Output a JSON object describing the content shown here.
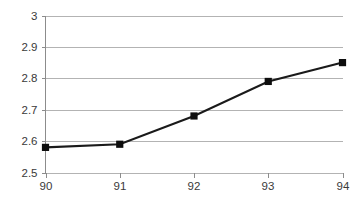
{
  "chart_data": {
    "type": "line",
    "title": "",
    "subtitle": "",
    "xlabel": "",
    "ylabel": "",
    "x": [
      90,
      91,
      92,
      93,
      94
    ],
    "categories": [
      "90",
      "91",
      "92",
      "93",
      "94"
    ],
    "values": [
      2.58,
      2.59,
      2.68,
      2.79,
      2.85
    ],
    "series": [
      {
        "name": "",
        "values": [
          2.58,
          2.59,
          2.68,
          2.79,
          2.85
        ]
      }
    ],
    "xlim": [
      90,
      94
    ],
    "ylim": [
      2.5,
      3.0
    ],
    "xticks": [
      "90",
      "91",
      "92",
      "93",
      "94"
    ],
    "yticks": [
      "2.5",
      "2.6",
      "2.7",
      "2.8",
      "2.9",
      "3"
    ],
    "ytick_values": [
      2.5,
      2.6,
      2.7,
      2.8,
      2.9,
      3.0
    ],
    "grid": "horizontal",
    "legend": "none",
    "marker": "square",
    "colors": {
      "line": "#1a1a1a",
      "marker": "#0d0d0d",
      "gridline": "#b3b3b3",
      "axis": "#8c8c8c",
      "label": "#3a3a3a",
      "background": "#ffffff"
    }
  },
  "axis": {
    "y_tick_labels": [
      "3",
      "2.9",
      "2.8",
      "2.7",
      "2.6",
      "2.5"
    ],
    "x_tick_labels": [
      "90",
      "91",
      "92",
      "93",
      "94"
    ]
  }
}
